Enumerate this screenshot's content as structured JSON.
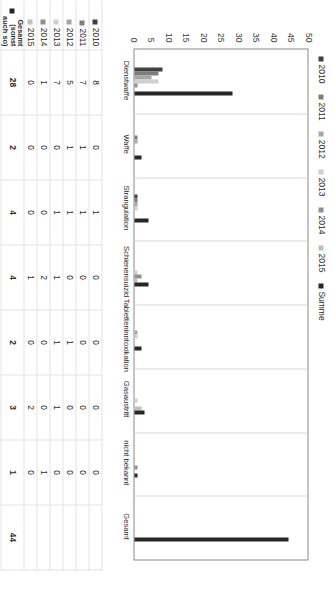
{
  "chart_data": {
    "type": "bar",
    "title": "",
    "xlabel": "",
    "ylabel": "",
    "ylim": [
      0,
      50
    ],
    "ytick_step": 5,
    "grid": true,
    "orientation": "vertical",
    "legend_position": "top",
    "categories": [
      "Dienstwaffe",
      "Waffe",
      "Strangulation",
      "Schienensuizid",
      "Tabletteninntoxikation",
      "Gasaustritt",
      "nicht bekannt",
      "Gesamt"
    ],
    "yticks": [
      "0",
      "5",
      "10",
      "15",
      "20",
      "25",
      "30",
      "35",
      "40",
      "45",
      "50"
    ],
    "series": [
      {
        "name": "2010",
        "color": "#404040",
        "values": [
          8,
          0,
          1,
          0,
          0,
          0,
          0,
          0
        ]
      },
      {
        "name": "2011",
        "color": "#7d7d7d",
        "values": [
          7,
          1,
          1,
          0,
          0,
          0,
          0,
          0
        ]
      },
      {
        "name": "2012",
        "color": "#a6a6a6",
        "values": [
          5,
          1,
          1,
          0,
          1,
          0,
          0,
          0
        ]
      },
      {
        "name": "2013",
        "color": "#d0d0d0",
        "values": [
          7,
          0,
          1,
          1,
          1,
          1,
          0,
          0
        ]
      },
      {
        "name": "2014",
        "color": "#8f8f8f",
        "values": [
          1,
          0,
          0,
          2,
          0,
          0,
          1,
          0
        ]
      },
      {
        "name": "2015",
        "color": "#bfbfbf",
        "values": [
          0,
          0,
          0,
          1,
          0,
          2,
          0,
          0
        ]
      },
      {
        "name": "Summe",
        "color": "#262626",
        "values": [
          28,
          2,
          4,
          4,
          2,
          3,
          1,
          44
        ]
      }
    ]
  },
  "legend": {
    "items": [
      {
        "label": "2010",
        "color": "#404040"
      },
      {
        "label": "2011",
        "color": "#7d7d7d"
      },
      {
        "label": "2012",
        "color": "#a6a6a6"
      },
      {
        "label": "2013",
        "color": "#d0d0d0"
      },
      {
        "label": "2014",
        "color": "#8f8f8f"
      },
      {
        "label": "2015",
        "color": "#bfbfbf"
      },
      {
        "label": "Summe",
        "color": "#262626"
      }
    ]
  },
  "data_table": {
    "column_headers": [
      "Dienstwaffe",
      "Waffe",
      "Strangulation",
      "Schienensuizid",
      "Tabletteninntoxikation",
      "Gasaustritt",
      "nicht bekannt",
      "Gesamt"
    ],
    "rows": [
      {
        "label": "2010",
        "label_line2": "",
        "label_line3": "",
        "color": "#404040",
        "values": [
          "8",
          "0",
          "1",
          "0",
          "0",
          "0",
          "0",
          ""
        ]
      },
      {
        "label": "2011",
        "label_line2": "",
        "label_line3": "",
        "color": "#7d7d7d",
        "values": [
          "7",
          "1",
          "1",
          "0",
          "0",
          "0",
          "0",
          ""
        ]
      },
      {
        "label": "2012",
        "label_line2": "",
        "label_line3": "",
        "color": "#a6a6a6",
        "values": [
          "5",
          "1",
          "1",
          "0",
          "1",
          "0",
          "0",
          ""
        ]
      },
      {
        "label": "2013",
        "label_line2": "",
        "label_line3": "",
        "color": "#d0d0d0",
        "values": [
          "7",
          "0",
          "1",
          "1",
          "1",
          "1",
          "0",
          ""
        ]
      },
      {
        "label": "2014",
        "label_line2": "",
        "label_line3": "",
        "color": "#8f8f8f",
        "values": [
          "1",
          "0",
          "0",
          "2",
          "0",
          "0",
          "1",
          ""
        ]
      },
      {
        "label": "2015",
        "label_line2": "",
        "label_line3": "",
        "color": "#bfbfbf",
        "values": [
          "0",
          "0",
          "0",
          "1",
          "0",
          "2",
          "0",
          ""
        ]
      },
      {
        "label": "Gesamt",
        "label_line2": "(sonst",
        "label_line3": "auch so)",
        "color": "#262626",
        "values": [
          "28",
          "2",
          "4",
          "4",
          "2",
          "3",
          "1",
          "44"
        ]
      }
    ]
  }
}
